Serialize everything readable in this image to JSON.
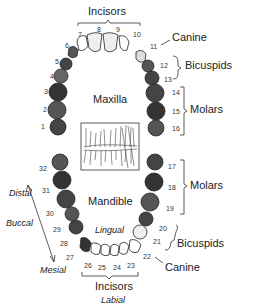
{
  "diagram": {
    "upper_arch": {
      "label": "Maxilla",
      "groups": {
        "incisors": "Incisors",
        "canine": "Canine",
        "bicuspids": "Bicuspids",
        "molars": "Molars"
      },
      "teeth": [
        "1",
        "2",
        "3",
        "4",
        "5",
        "6",
        "7",
        "8",
        "9",
        "10",
        "11",
        "12",
        "13",
        "14",
        "15",
        "16"
      ]
    },
    "lower_arch": {
      "label": "Mandible",
      "groups": {
        "incisors": "Incisors",
        "canine": "Canine",
        "bicuspids": "Bicuspids",
        "molars": "Molars"
      },
      "teeth": [
        "17",
        "18",
        "19",
        "20",
        "21",
        "22",
        "23",
        "24",
        "25",
        "26",
        "27",
        "28",
        "29",
        "30",
        "31",
        "32"
      ]
    },
    "directions": {
      "distal": "Distal",
      "buccal": "Buccal",
      "mesial": "Mesial",
      "lingual": "Lingual",
      "labial": "Labial"
    }
  }
}
